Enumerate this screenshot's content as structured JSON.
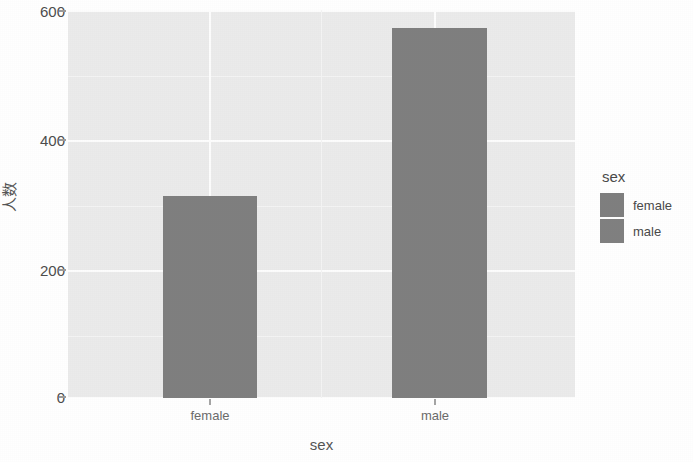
{
  "chart_data": {
    "type": "bar",
    "title": "",
    "subtitle": "",
    "xlabel": "sex",
    "ylabel": "人数",
    "categories": [
      "female",
      "male"
    ],
    "values": [
      313,
      572
    ],
    "series": [
      {
        "name": "count",
        "values": [
          313,
          572
        ]
      }
    ],
    "ylim": [
      0,
      620
    ],
    "y_ticks": [
      0,
      200,
      400,
      600
    ],
    "y_tick_labels": [
      "0",
      "200",
      "400",
      "600"
    ],
    "x_tick_labels": [
      "female",
      "male"
    ],
    "grid": true,
    "legend_position": "right",
    "legend": {
      "title": "sex",
      "entries": [
        {
          "label": "female",
          "color": "#7f7f7f"
        },
        {
          "label": "male",
          "color": "#808080"
        }
      ]
    },
    "colors": {
      "panel_background": "#ebebeb",
      "gridline": "#fdfdfd",
      "bar_fill": "#7f7f7f",
      "axis_text": "#4d4d4d",
      "figure_background": "#ffffff"
    }
  },
  "axes": {
    "y_tick_0": "0",
    "y_tick_1": "200",
    "y_tick_2": "400",
    "y_tick_3": "600",
    "x_tick_0": "female",
    "x_tick_1": "male",
    "x_title": "sex",
    "y_title": "人数"
  },
  "legend": {
    "title": "sex",
    "item_0": "female",
    "item_1": "male"
  }
}
